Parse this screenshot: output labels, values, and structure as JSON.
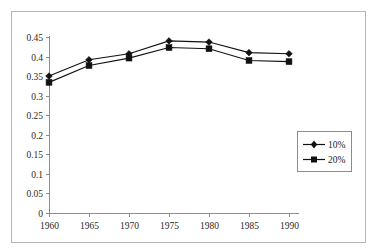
{
  "figure": {
    "top_caption_fragment": "",
    "frame_color": "#b5b5b5",
    "background": "#ffffff"
  },
  "legend": {
    "position": "right-middle",
    "entries": [
      {
        "label": "10%",
        "marker": "diamond-marker-icon",
        "color": "#111111"
      },
      {
        "label": "20%",
        "marker": "square-marker-icon",
        "color": "#111111"
      }
    ]
  },
  "chart_data": {
    "type": "line",
    "title": "",
    "subtitle": "",
    "xlabel": "",
    "ylabel": "",
    "x": [
      1960,
      1965,
      1970,
      1975,
      1980,
      1985,
      1990
    ],
    "categories": [
      "1960",
      "1965",
      "1970",
      "1975",
      "1980",
      "1985",
      "1990"
    ],
    "xtick_labels": [
      "1960",
      "1965",
      "1970",
      "1975",
      "1980",
      "1985",
      "1990"
    ],
    "ytick_labels": [
      "0",
      "0.05",
      "0.1",
      "0.15",
      "0.2",
      "0.25",
      "0.3",
      "0.35",
      "0.4",
      "0.45"
    ],
    "yticks": [
      0,
      0.05,
      0.1,
      0.15,
      0.2,
      0.25,
      0.3,
      0.35,
      0.4,
      0.45
    ],
    "ylim": [
      0,
      0.45
    ],
    "xlim": [
      1960,
      1990
    ],
    "grid": false,
    "legend_position": "right",
    "series": [
      {
        "name": "10%",
        "marker": "diamond",
        "color": "#111111",
        "values": [
          0.35,
          0.392,
          0.407,
          0.44,
          0.437,
          0.41,
          0.407
        ]
      },
      {
        "name": "20%",
        "marker": "square",
        "color": "#111111",
        "values": [
          0.334,
          0.377,
          0.396,
          0.423,
          0.42,
          0.39,
          0.387
        ]
      }
    ]
  }
}
